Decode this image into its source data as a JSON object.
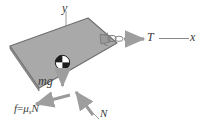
{
  "figure": {
    "type": "free-body-diagram",
    "background_color": "#ffffff"
  },
  "block": {
    "name": "block",
    "fill_color": "#a9a9a9",
    "stroke_color": "#6e6e6e",
    "tilt_degrees": -16
  },
  "axes": {
    "y": {
      "label": "y"
    },
    "x": {
      "label": "x"
    },
    "line_color": "#8a8a8a"
  },
  "center_of_mass": {
    "label": "",
    "symbol": "checkered-circle"
  },
  "forces": [
    {
      "id": "tension",
      "label": "T",
      "subscript": "",
      "direction": "right",
      "arrow_color": "#9a9a9a"
    },
    {
      "id": "weight",
      "label": "mg",
      "subscript": "",
      "direction": "down",
      "arrow_color": "#9a9a9a"
    },
    {
      "id": "normal",
      "label": "N",
      "subscript": "",
      "direction": "up-left",
      "arrow_color": "#9a9a9a"
    },
    {
      "id": "friction",
      "label": "f",
      "equals": "=",
      "mu": "μ",
      "subscript": "s",
      "normal_symbol": "N",
      "direction": "left",
      "arrow_color": "#9a9a9a"
    }
  ],
  "hook": {
    "name": "eyelet-hook",
    "color": "#8f8f8f"
  }
}
